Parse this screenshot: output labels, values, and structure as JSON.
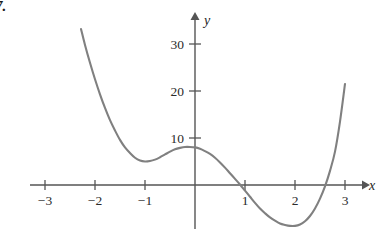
{
  "figure": {
    "problem_number": "7.",
    "background_color": "#ffffff",
    "axis_color": "#555555",
    "curve_color": "#808080",
    "text_color": "#2b2b2b"
  },
  "chart_data": {
    "type": "line",
    "title": "",
    "subtitle": "",
    "xlabel": "x",
    "ylabel": "y",
    "xlim": [
      -3.4,
      3.6
    ],
    "ylim": [
      -11,
      35
    ],
    "grid": false,
    "legend": null,
    "annotations": [],
    "x_ticks": [
      {
        "value": -3,
        "label": "−3"
      },
      {
        "value": -2,
        "label": "−2"
      },
      {
        "value": -1,
        "label": "−1"
      },
      {
        "value": 1,
        "label": "1"
      },
      {
        "value": 2,
        "label": "2"
      },
      {
        "value": 3,
        "label": "3"
      }
    ],
    "y_ticks": [
      {
        "value": 10,
        "label": "10"
      },
      {
        "value": 20,
        "label": "20"
      },
      {
        "value": 30,
        "label": "30"
      }
    ],
    "series": [
      {
        "name": "curve",
        "color": "#808080",
        "x": [
          -2.28,
          -2.2,
          -2.1,
          -2.0,
          -1.9,
          -1.8,
          -1.7,
          -1.6,
          -1.5,
          -1.4,
          -1.3,
          -1.2,
          -1.1,
          -1.0,
          -0.9,
          -0.8,
          -0.7,
          -0.6,
          -0.5,
          -0.4,
          -0.3,
          -0.2,
          -0.1,
          0.0,
          0.1,
          0.2,
          0.3,
          0.4,
          0.5,
          0.6,
          0.7,
          0.8,
          0.9,
          1.0,
          1.1,
          1.2,
          1.3,
          1.4,
          1.5,
          1.6,
          1.7,
          1.8,
          1.9,
          2.0,
          2.1,
          2.2,
          2.3,
          2.4,
          2.5,
          2.6,
          2.7,
          2.8,
          2.9,
          3.0
        ],
        "y": [
          33.2,
          29.8,
          26.0,
          22.5,
          19.3,
          16.4,
          13.8,
          11.6,
          9.6,
          8.0,
          6.8,
          5.8,
          5.2,
          5.0,
          5.1,
          5.4,
          5.9,
          6.5,
          7.1,
          7.6,
          7.9,
          8.1,
          8.1,
          8.0,
          7.7,
          7.2,
          6.6,
          5.8,
          4.8,
          3.7,
          2.5,
          1.3,
          0.1,
          -1.2,
          -2.5,
          -3.8,
          -5.0,
          -6.0,
          -6.9,
          -7.6,
          -8.2,
          -8.5,
          -8.7,
          -8.7,
          -8.4,
          -7.7,
          -6.6,
          -5.0,
          -2.9,
          -0.3,
          3.0,
          7.1,
          13.5,
          21.5
        ]
      }
    ]
  }
}
